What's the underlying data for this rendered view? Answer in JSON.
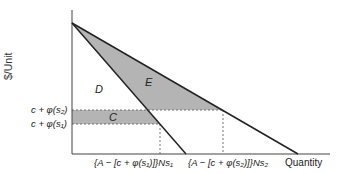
{
  "diagram": {
    "y_axis_label": "$/Unit",
    "x_axis_label": "Quantity",
    "regions": {
      "C": "C",
      "D": "D",
      "E": "E"
    },
    "y_ticks": [
      "c + φ(s₂)",
      "c + φ(s₁)"
    ],
    "x_ticks": [
      "{A − [c + φ(s₁)]}Ns₁",
      "{A − [c + φ(s₂)]}Ns₂"
    ],
    "colors": {
      "shade": "#b4b4b4",
      "line": "#222222",
      "dash": "#555555"
    }
  }
}
